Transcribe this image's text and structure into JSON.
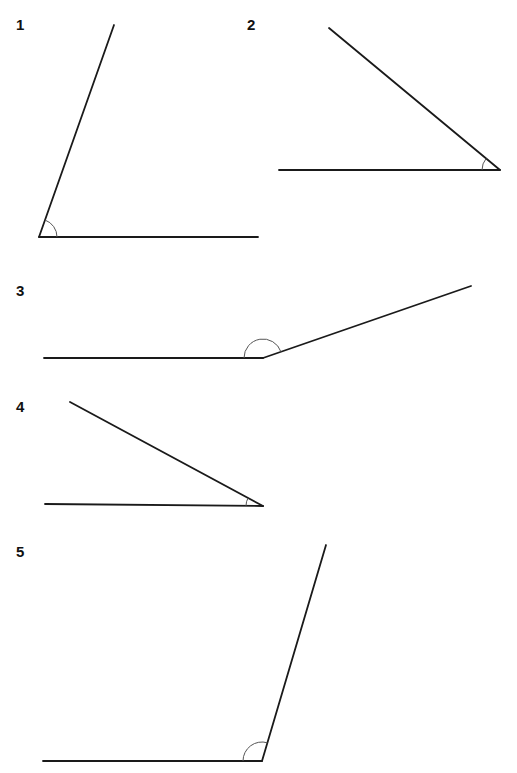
{
  "diagram": {
    "type": "angle-set",
    "line_color": "#1a1a1a",
    "arc_color": "#555555",
    "angles": [
      {
        "label": "1",
        "label_pos": [
          16,
          17
        ],
        "vertex": [
          39,
          237
        ],
        "ray_a": [
          258,
          237
        ],
        "ray_b": [
          114,
          25
        ],
        "arc_radius": 18,
        "kind": "acute"
      },
      {
        "label": "2",
        "label_pos": [
          247,
          17
        ],
        "vertex": [
          500,
          170
        ],
        "ray_a": [
          279,
          170
        ],
        "ray_b": [
          329,
          28
        ],
        "arc_radius": 18,
        "kind": "acute"
      },
      {
        "label": "3",
        "label_pos": [
          16,
          283
        ],
        "vertex": [
          263,
          358
        ],
        "ray_a": [
          44,
          358
        ],
        "ray_b": [
          471,
          286
        ],
        "arc_radius": 19,
        "kind": "obtuse"
      },
      {
        "label": "4",
        "label_pos": [
          16,
          399
        ],
        "vertex": [
          263,
          506
        ],
        "ray_a": [
          45,
          504
        ],
        "ray_b": [
          70,
          402
        ],
        "arc_radius": 17,
        "kind": "acute"
      },
      {
        "label": "5",
        "label_pos": [
          16,
          544
        ],
        "vertex": [
          262,
          761
        ],
        "ray_a": [
          43,
          761
        ],
        "ray_b": [
          326,
          545
        ],
        "arc_radius": 19,
        "kind": "obtuse"
      }
    ]
  }
}
